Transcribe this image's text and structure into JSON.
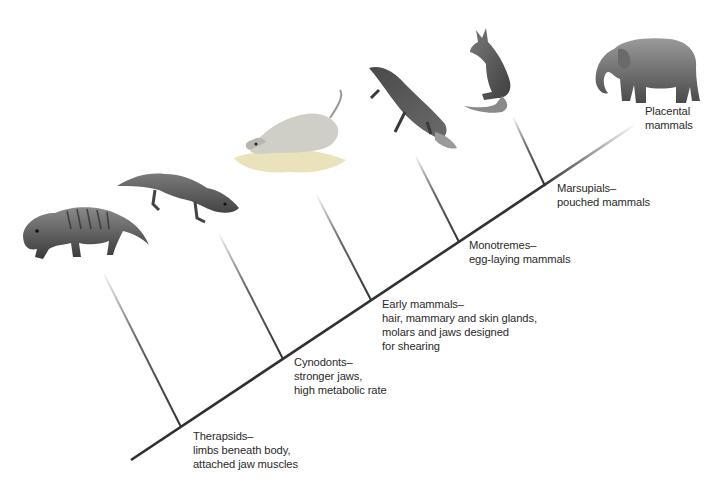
{
  "diagram": {
    "type": "cladogram",
    "main_axis": {
      "from": [
        131,
        460
      ],
      "to": [
        636,
        124
      ],
      "color": "#333333"
    },
    "clades": [
      {
        "name": "Therapsids",
        "lines": [
          "Therapsids–",
          "limbs beneath body,",
          "attached jaw muscles"
        ],
        "animal": "therapsid",
        "branch": {
          "top": [
            103,
            272
          ],
          "bottom": [
            181,
            427
          ]
        },
        "label_pos": [
          193,
          429
        ]
      },
      {
        "name": "Cynodonts",
        "lines": [
          "Cynodonts–",
          "stronger jaws,",
          "high metabolic rate"
        ],
        "animal": "cynodont",
        "branch": {
          "top": [
            218,
            232
          ],
          "bottom": [
            283,
            359
          ]
        },
        "label_pos": [
          294,
          355
        ]
      },
      {
        "name": "Early mammals",
        "lines": [
          "Early mammals–",
          "hair, mammary and skin glands,",
          "molars and jaws designed",
          "for shearing"
        ],
        "animal": "early-mammal",
        "branch": {
          "top": [
            316,
            194
          ],
          "bottom": [
            371,
            300
          ]
        },
        "label_pos": [
          382,
          297
        ]
      },
      {
        "name": "Monotremes",
        "lines": [
          "Monotremes–",
          "egg-laying mammals"
        ],
        "animal": "platypus",
        "branch": {
          "top": [
            415,
            155
          ],
          "bottom": [
            459,
            242
          ]
        },
        "label_pos": [
          469,
          238
        ]
      },
      {
        "name": "Marsupials",
        "lines": [
          "Marsupials–",
          "pouched mammals"
        ],
        "animal": "kangaroo",
        "branch": {
          "top": [
            513,
            117
          ],
          "bottom": [
            545,
            186
          ]
        },
        "label_pos": [
          557,
          181
        ]
      },
      {
        "name": "Placental mammals",
        "lines": [
          "Placental",
          "mammals"
        ],
        "animal": "elephant",
        "branch": null,
        "label_pos": [
          645,
          104
        ]
      }
    ]
  }
}
